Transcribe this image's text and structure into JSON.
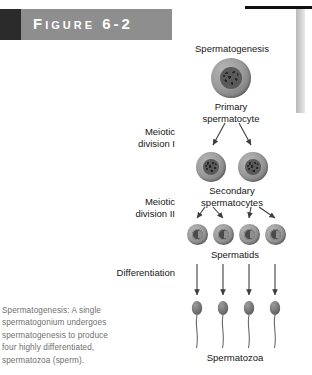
{
  "figure": {
    "banner_label": "Figure 6-2",
    "banner_dark_color": "#2b2b2b",
    "banner_gray_color": "#8e8e8e",
    "banner_text_color": "#ffffff"
  },
  "diagram": {
    "title": "Spermatogenesis",
    "stage_labels": {
      "primary_spermatocyte": "Primary\nspermatocyte",
      "secondary_spermatocytes": "Secondary\nspermatocytes",
      "spermatids": "Spermatids",
      "spermatozoa": "Spermatozoa"
    },
    "process_labels": {
      "meiotic_division_1": "Meiotic\ndivision I",
      "meiotic_division_2": "Meiotic\ndivision II",
      "differentiation": "Differentiation"
    },
    "counts": {
      "primary_spermatocyte": 1,
      "secondary_spermatocytes": 2,
      "spermatids": 4,
      "spermatozoa": 4
    },
    "cell_color": "#9a9a9a",
    "nucleus_color": "#4e4e4e",
    "arrow_color": "#3d3d3d"
  },
  "caption": {
    "text": "Spermatogenesis: A single spermatogonium undergoes spermatogenesis to produce four highly differentiated, spermatozoa (sperm).",
    "color": "#6f6f6f"
  }
}
